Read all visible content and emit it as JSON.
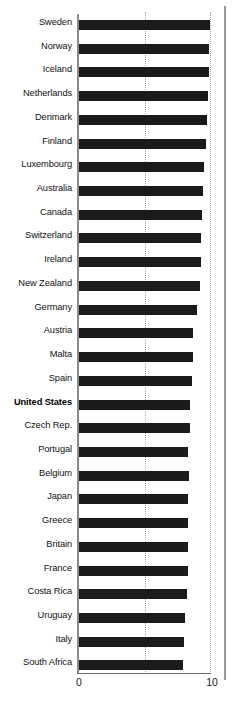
{
  "chart_data": {
    "type": "bar",
    "orientation": "horizontal",
    "title": "",
    "subtitle": "",
    "xlabel": "",
    "ylabel": "",
    "xlim": [
      0,
      10
    ],
    "xticks": [
      "0",
      "10"
    ],
    "xtick_values": [
      0,
      10
    ],
    "gridlines": [
      5,
      10
    ],
    "grid": true,
    "legend": null,
    "bar_color": "#1b1b1b",
    "highlight_category": "United States",
    "categories": [
      "Sweden",
      "Norway",
      "Iceland",
      "Netherlands",
      "Denmark",
      "Finland",
      "Luxembourg",
      "Australia",
      "Canada",
      "Switzerland",
      "Ireland",
      "New Zealand",
      "Germany",
      "Austria",
      "Malta",
      "Spain",
      "United States",
      "Czech Rep.",
      "Portugal",
      "Belgium",
      "Japan",
      "Greece",
      "Britain",
      "France",
      "Costa Rica",
      "Uruguay",
      "Italy",
      "South Africa"
    ],
    "values": [
      9.88,
      9.8,
      9.76,
      9.73,
      9.65,
      9.52,
      9.4,
      9.33,
      9.27,
      9.21,
      9.16,
      9.12,
      8.9,
      8.6,
      8.55,
      8.51,
      8.38,
      8.32,
      8.18,
      8.26,
      8.22,
      8.2,
      8.18,
      8.16,
      8.1,
      7.98,
      7.92,
      7.84
    ]
  },
  "axis": {
    "zero_label": "0",
    "ten_label": "10"
  },
  "footer": {
    "cropped_text": ""
  }
}
